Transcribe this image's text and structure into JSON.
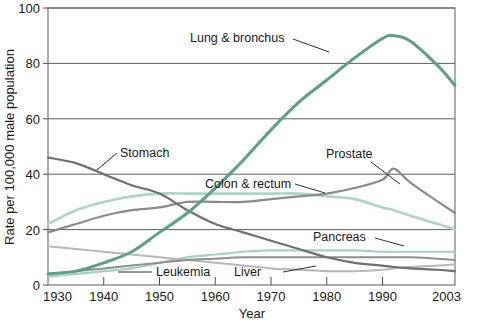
{
  "chart_data": {
    "type": "line",
    "title": "",
    "xlabel": "Year",
    "ylabel": "Rate per 100,000 male population",
    "xlim": [
      1930,
      2003
    ],
    "ylim": [
      0,
      100
    ],
    "xticks": [
      "1930",
      "1940",
      "1950",
      "1960",
      "1970",
      "1980",
      "1990",
      "2003"
    ],
    "xtick_values": [
      1930,
      1940,
      1950,
      1960,
      1970,
      1980,
      1990,
      2003
    ],
    "yticks": [
      "0",
      "20",
      "40",
      "60",
      "80",
      "100"
    ],
    "ytick_values": [
      0,
      20,
      40,
      60,
      80,
      100
    ],
    "grid": "horizontal",
    "legend_position": "inline-annotations",
    "x": [
      1930,
      1935,
      1940,
      1945,
      1950,
      1955,
      1960,
      1965,
      1970,
      1975,
      1980,
      1985,
      1990,
      1992,
      1995,
      2000,
      2003
    ],
    "series": [
      {
        "name": "Lung & bronchus",
        "color": "#5e9e8c",
        "width": 3.0,
        "values": [
          4,
          5,
          8,
          12,
          19,
          26,
          35,
          45,
          56,
          66,
          74,
          82,
          89,
          90,
          88,
          79,
          72
        ]
      },
      {
        "name": "Stomach",
        "color": "#6f6f6f",
        "width": 2.2,
        "values": [
          46,
          44,
          40,
          36,
          33,
          27,
          22,
          19,
          16,
          13,
          10,
          8,
          7,
          6.5,
          6,
          5.5,
          5
        ]
      },
      {
        "name": "Colon & rectum",
        "color": "#aed3c7",
        "width": 2.6,
        "values": [
          22,
          27,
          30,
          32,
          33,
          33,
          33,
          33,
          33,
          33,
          32,
          31,
          28,
          27,
          25,
          22,
          20
        ]
      },
      {
        "name": "Prostate",
        "color": "#8a8a8a",
        "width": 2.2,
        "values": [
          19,
          22,
          25,
          27,
          28,
          30,
          30,
          30,
          31,
          32,
          33,
          35,
          38,
          42,
          37,
          30,
          26
        ]
      },
      {
        "name": "Pancreas",
        "color": "#a7cfc3",
        "width": 2.2,
        "values": [
          3,
          4,
          5,
          6,
          8,
          10,
          11,
          12,
          12.5,
          12.5,
          12.5,
          12.5,
          12,
          12,
          12,
          12,
          12
        ]
      },
      {
        "name": "Leukemia",
        "color": "#8f8f8f",
        "width": 2.0,
        "values": [
          4,
          5,
          6,
          7,
          8,
          9,
          9.5,
          10,
          10,
          10,
          10,
          10,
          10,
          10,
          10,
          9.5,
          9
        ]
      },
      {
        "name": "Liver",
        "color": "#b7b7b7",
        "width": 2.0,
        "values": [
          14,
          13,
          12,
          11,
          10,
          9,
          8,
          7,
          6,
          5.5,
          5,
          5,
          5.5,
          6,
          6.5,
          7,
          7.5
        ]
      }
    ],
    "annotations": [
      {
        "label": "Lung & bronchus",
        "text_x": 190,
        "text_y": 42,
        "line": "M 293 39 L 329 52"
      },
      {
        "label": "Stomach",
        "text_x": 120,
        "text_y": 157,
        "line": "M 97 170 L 117 153"
      },
      {
        "label": "Colon & rectum",
        "text_x": 205,
        "text_y": 188,
        "line": "M 295 184 L 325 193"
      },
      {
        "label": "Prostate",
        "text_x": 326,
        "text_y": 158,
        "line": "M 371 162 L 400 184"
      },
      {
        "label": "Pancreas",
        "text_x": 313,
        "text_y": 241,
        "line": "M 375 238 L 404 246"
      },
      {
        "label": "Leukemia",
        "text_x": 156,
        "text_y": 276,
        "line": "M 118 272 L 152 272"
      },
      {
        "label": "Liver",
        "text_x": 234,
        "text_y": 276,
        "line": "M 283 272 L 316 266"
      }
    ]
  },
  "axes": {
    "x_title": "Year",
    "y_title": "Rate per 100,000 male population"
  },
  "colors": {
    "background": "#ffffff",
    "frame": "#6b6b6b",
    "grid": "#4d4d4d",
    "text": "#1a1a1a"
  }
}
